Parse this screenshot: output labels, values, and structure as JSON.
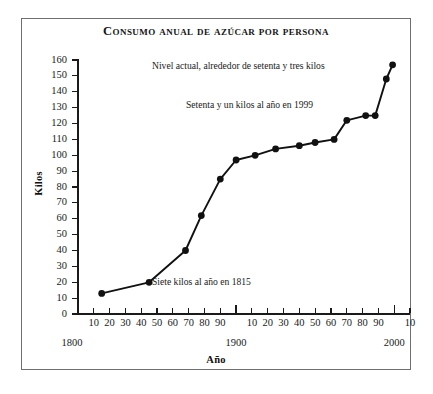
{
  "chart_data": {
    "type": "line",
    "title": "Consumo anual de azúcar por persona",
    "xlabel": "Año",
    "ylabel": "Kilos",
    "xlim": [
      1800,
      2010
    ],
    "ylim": [
      0,
      160
    ],
    "grid": false,
    "legend": "none",
    "y_ticks": [
      0,
      10,
      20,
      30,
      40,
      50,
      60,
      70,
      80,
      90,
      100,
      110,
      120,
      130,
      140,
      150,
      160
    ],
    "x_tick_labels": [
      "10",
      "20",
      "30",
      "40",
      "50",
      "60",
      "70",
      "80",
      "90",
      "10",
      "20",
      "30",
      "40",
      "50",
      "60",
      "70",
      "80",
      "90",
      "10"
    ],
    "x_century_labels": [
      "1800",
      "1900",
      "2000"
    ],
    "series": [
      {
        "name": "Consumo anual de azúcar por persona",
        "x": [
          1815,
          1845,
          1868,
          1878,
          1890,
          1900,
          1912,
          1925,
          1940,
          1950,
          1962,
          1970,
          1982,
          1988,
          1995,
          1999
        ],
        "values": [
          13,
          20,
          40,
          62,
          85,
          97,
          100,
          104,
          106,
          108,
          110,
          122,
          125,
          125,
          148,
          157
        ]
      }
    ],
    "annotations": [
      {
        "text": "Nivel actual, alrededor de setenta y tres kilos",
        "x_px": 152,
        "y_px": 60
      },
      {
        "text": "Setenta y un kilos al año en 1999",
        "x_px": 186,
        "y_px": 99
      },
      {
        "text": "Siete kilos al año en 1815",
        "x_px": 152,
        "y_px": 276
      }
    ]
  }
}
